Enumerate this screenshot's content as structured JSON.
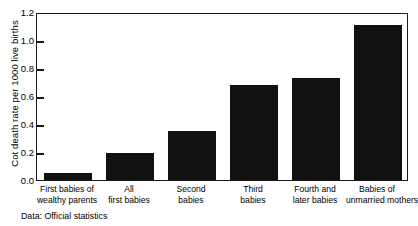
{
  "chart_data": {
    "type": "bar",
    "title": "",
    "subtitle": "",
    "xlabel": "",
    "ylabel": "Cot death rate per 1000 live births",
    "categories": [
      "First babies of wealthy parents",
      "All first babies",
      "Second babies",
      "Third babies",
      "Fourth and later babies",
      "Babies of unmarried mothers"
    ],
    "category_lines": [
      [
        "First babies of",
        "wealthy parents"
      ],
      [
        "All",
        "first babies"
      ],
      [
        "Second",
        "babies"
      ],
      [
        "Third",
        "babies"
      ],
      [
        "Fourth and",
        "later babies"
      ],
      [
        "Babies of",
        "unmarried mothers"
      ]
    ],
    "values": [
      0.05,
      0.19,
      0.35,
      0.68,
      0.73,
      1.11
    ],
    "ylim": [
      0.0,
      1.2
    ],
    "ytick_labels": [
      "0.0",
      "0.2",
      "0.4",
      "0.6",
      "0.8",
      "1.0",
      "1.2"
    ],
    "ytick_values": [
      0.0,
      0.2,
      0.4,
      0.6,
      0.8,
      1.0,
      1.2
    ],
    "grid": false,
    "legend": "none",
    "bar_color": "#111111",
    "axis_color": "#1a1a1a"
  },
  "footnote": "Data: Official statistics"
}
